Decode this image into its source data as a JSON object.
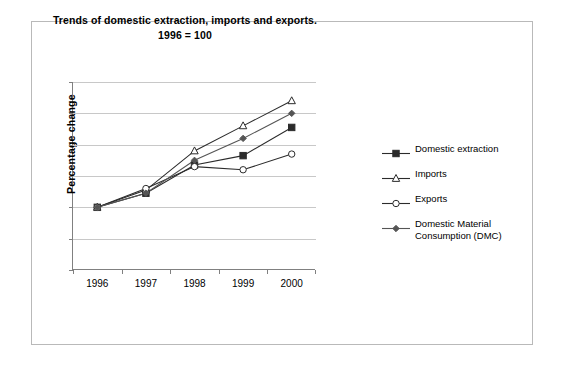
{
  "chart_data": {
    "type": "line",
    "title": "Trends of domestic extraction, imports and exports.",
    "subtitle": "1996 = 100",
    "xlabel": "",
    "ylabel": "Percentage change",
    "categories": [
      "1996",
      "1997",
      "1998",
      "1999",
      "2000"
    ],
    "ylim": [
      80,
      140
    ],
    "yticks": [
      80,
      90,
      100,
      110,
      120,
      130,
      140
    ],
    "grid": true,
    "legend_position": "right",
    "series": [
      {
        "name": "Domestic extraction",
        "marker": "filled-square",
        "color": "#2b2b2b",
        "values": [
          100,
          104.5,
          113.5,
          116.5,
          125.5
        ]
      },
      {
        "name": "Imports",
        "marker": "open-triangle",
        "color": "#2b2b2b",
        "values": [
          100,
          105.5,
          118,
          126,
          134
        ]
      },
      {
        "name": "Exports",
        "marker": "open-circle",
        "color": "#2b2b2b",
        "values": [
          100,
          106,
          113,
          112,
          117
        ]
      },
      {
        "name": "Domestic Material Consumption (DMC)",
        "marker": "filled-diamond",
        "color": "#555555",
        "values": [
          100,
          104.5,
          115,
          122,
          130
        ]
      }
    ]
  },
  "legend": {
    "items": [
      {
        "label": "Domestic extraction",
        "label2": ""
      },
      {
        "label": "Imports",
        "label2": ""
      },
      {
        "label": "Exports",
        "label2": ""
      },
      {
        "label": "Domestic Material",
        "label2": "Consumption (DMC)"
      }
    ]
  }
}
